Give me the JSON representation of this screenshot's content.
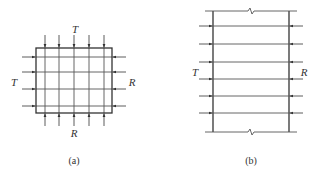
{
  "colors": {
    "line": "#333333",
    "thin": "#555555",
    "background": "#ffffff"
  },
  "panel_a": {
    "caption": "(a)",
    "label_top": "T",
    "label_left": "T",
    "label_right": "R",
    "label_bottom": "R",
    "box": {
      "x1": 36,
      "y1": 48,
      "x2": 112,
      "y2": 113
    },
    "vertical_lines_x": [
      45,
      59,
      74,
      89,
      104
    ],
    "horizontal_lines_y": [
      57,
      72,
      89,
      106
    ]
  },
  "panel_b": {
    "caption": "(b)",
    "label_left": "T",
    "label_right": "R",
    "walls_x": [
      213,
      289
    ],
    "top_y": 11,
    "bottom_y": 132,
    "horizontal_lines_y": [
      26,
      44,
      62,
      79,
      96,
      113
    ]
  }
}
